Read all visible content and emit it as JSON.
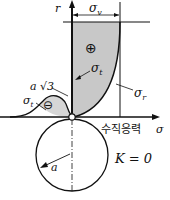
{
  "diagram": {
    "axis_r_label": "r",
    "axis_sigma_label": "σ",
    "sigma_axis_korean": "수직응력",
    "sigma_v_label": "σ",
    "sigma_v_sub": "v",
    "sigma_t_label": "σ",
    "sigma_t_sub": "t",
    "sigma_r_label": "σ",
    "sigma_r_sub": "r",
    "sigma_t_left_label": "σ",
    "sigma_t_left_sub": "t",
    "a_sqrt3_label": "a √3",
    "plus_sign": "⊕",
    "minus_sign": "⊖",
    "radius_label": "a",
    "k_label": "K = 0",
    "colors": {
      "fill": "#c8c8c8",
      "stroke": "#111111"
    }
  }
}
